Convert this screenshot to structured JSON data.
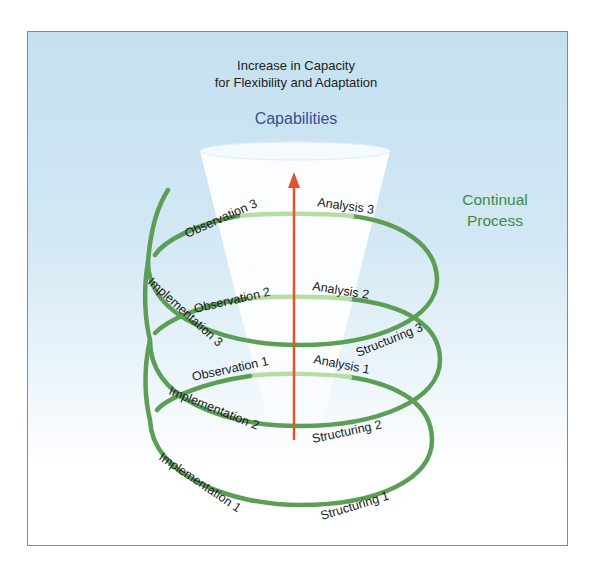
{
  "header": {
    "title_line1": "Increase in Capacity",
    "title_line2": "for Flexibility and Adaptation"
  },
  "cone_label": "Capabilities",
  "side_label": {
    "line1": "Continual",
    "line2": "Process"
  },
  "spiral_labels": {
    "observation_3": "Observation 3",
    "analysis_3": "Analysis 3",
    "implementation_3": "Implementation 3",
    "observation_2": "Observation 2",
    "analysis_2": "Analysis 2",
    "structuring_3": "Structuring 3",
    "observation_1": "Observation 1",
    "analysis_1": "Analysis 1",
    "implementation_2": "Implementation 2",
    "structuring_2": "Structuring 2",
    "implementation_1": "Implementation 1",
    "structuring_1": "Structuring 1"
  },
  "colors": {
    "spiral": "#5c9e56",
    "spiral_faded": "#b9dca6",
    "arrow": "#e2542c",
    "capabilities_text": "#3a4f96",
    "continual_text": "#3e8a44",
    "background_top": "#c4e0f0",
    "frame_border": "#7d8a9a"
  }
}
